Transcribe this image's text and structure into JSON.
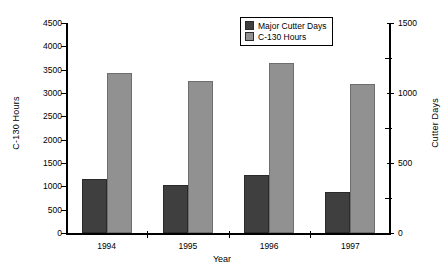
{
  "chart_data": {
    "type": "bar",
    "title": "",
    "xlabel": "Year",
    "ylabel": "C-130 Hours",
    "y2label": "Cutter Days",
    "categories": [
      "1994",
      "1995",
      "1996",
      "1997"
    ],
    "series": [
      {
        "name": "Major Cutter Days",
        "axis": "right",
        "color": "#3f3f3f",
        "values": [
          385,
          340,
          415,
          295
        ]
      },
      {
        "name": "C-130 Hours",
        "axis": "left",
        "color": "#919191",
        "values": [
          3420,
          3250,
          3650,
          3200
        ]
      }
    ],
    "ylim": [
      0,
      4500
    ],
    "y2lim": [
      0,
      1500
    ],
    "yticks": [
      0,
      500,
      1000,
      1500,
      2000,
      2500,
      3000,
      3500,
      4000,
      4500
    ],
    "y2ticks": [
      0,
      500,
      1000,
      1500
    ],
    "y2minorticks": [
      250,
      750,
      1250
    ],
    "grid": false,
    "legend_position": "top-center"
  },
  "legend": {
    "entries": [
      {
        "label": "Major Cutter Days",
        "swatch": "dark"
      },
      {
        "label": "C-130 Hours",
        "swatch": "light"
      }
    ]
  }
}
